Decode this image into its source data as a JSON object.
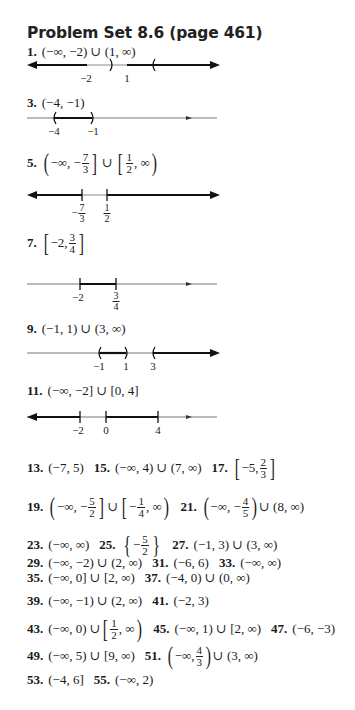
{
  "heading": "Problem Set 8.6 (page 461)",
  "answers": {
    "a1": {
      "num": "1.",
      "text": "(−∞, −2) ∪ (1, ∞)",
      "ticks": [
        "−2",
        "1"
      ]
    },
    "a3": {
      "num": "3.",
      "text": "(−4, −1)",
      "ticks": [
        "−4",
        "−1"
      ]
    },
    "a5": {
      "num": "5.",
      "pre": "−∞, −",
      "n1": "7",
      "d1": "3",
      "mid": "∪",
      "n2": "1",
      "d2": "2",
      "post": ", ∞",
      "ticks": [
        {
          "sign": "−",
          "n": "7",
          "d": "3"
        },
        {
          "n": "1",
          "d": "2"
        }
      ]
    },
    "a7": {
      "num": "7.",
      "pre": "−2, ",
      "n": "3",
      "d": "4",
      "ticks": [
        "−2",
        {
          "n": "3",
          "d": "4"
        }
      ]
    },
    "a9": {
      "num": "9.",
      "text": "(−1, 1) ∪ (3, ∞)",
      "ticks": [
        "−1",
        "1",
        "3"
      ]
    },
    "a11": {
      "num": "11.",
      "text": "(−∞, −2] ∪ [0, 4]",
      "ticks": [
        "−2",
        "0",
        "4"
      ]
    },
    "a13": {
      "num": "13.",
      "text": "(−7, 5)"
    },
    "a15": {
      "num": "15.",
      "text": "(−∞, 4) ∪ (7, ∞)"
    },
    "a17": {
      "num": "17.",
      "pre": "−5, ",
      "n": "2",
      "d": "3"
    },
    "a19": {
      "num": "19.",
      "pre": "−∞, −",
      "n1": "5",
      "d1": "2",
      "mid": "∪",
      "pre2": "−",
      "n2": "1",
      "d2": "4",
      "post": ", ∞"
    },
    "a21": {
      "num": "21.",
      "pre": "−∞, −",
      "n": "4",
      "d": "5",
      "post": "∪ (8, ∞)"
    },
    "a23": {
      "num": "23.",
      "text": "(−∞, ∞)"
    },
    "a25": {
      "num": "25.",
      "pre": "−",
      "n": "5",
      "d": "2"
    },
    "a27": {
      "num": "27.",
      "text": "(−1, 3) ∪ (3, ∞)"
    },
    "a29": {
      "num": "29.",
      "text": "(−∞, −2) ∪ (2, ∞)"
    },
    "a31": {
      "num": "31.",
      "text": "(−6, 6)"
    },
    "a33": {
      "num": "33.",
      "text": "(−∞, ∞)"
    },
    "a35": {
      "num": "35.",
      "text": "(−∞, 0] ∪ [2, ∞)"
    },
    "a37": {
      "num": "37.",
      "text": "(−4, 0) ∪ (0, ∞)"
    },
    "a39": {
      "num": "39.",
      "text": "(−∞, −1) ∪ (2, ∞)"
    },
    "a41": {
      "num": "41.",
      "text": "(−2, 3)"
    },
    "a43": {
      "num": "43.",
      "pre": "(−∞, 0) ∪ ",
      "n": "1",
      "d": "2",
      "post": ", ∞"
    },
    "a45": {
      "num": "45.",
      "text": "(−∞, 1) ∪ [2, ∞)"
    },
    "a47": {
      "num": "47.",
      "text": "(−6, −3)"
    },
    "a49": {
      "num": "49.",
      "text": "(−∞, 5) ∪ [9, ∞)"
    },
    "a51": {
      "num": "51.",
      "pre": "−∞, ",
      "n": "4",
      "d": "3",
      "post": "∪ (3, ∞)"
    },
    "a53": {
      "num": "53.",
      "text": "(−4, 6]"
    },
    "a55": {
      "num": "55.",
      "text": "(−∞, 2)"
    }
  }
}
